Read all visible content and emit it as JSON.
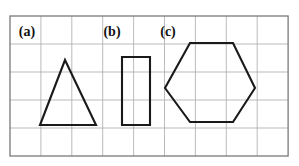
{
  "canvas": {
    "width": 299,
    "height": 166,
    "background": "#ffffff"
  },
  "grid": {
    "x0": 10,
    "y0": 16,
    "columns": 9,
    "rows": 5,
    "cell_width": 30.9,
    "cell_height": 28.0,
    "line_color": "#a9a9a9",
    "border_color": "#6e6e6e"
  },
  "style": {
    "shape_stroke": "#1a1a1a",
    "shape_stroke_width": 2.1,
    "label_color": "#111111"
  },
  "figures": [
    {
      "key": "triangle",
      "label": "(a)",
      "label_x": 27,
      "label_y": 33,
      "shape": "triangle",
      "points": "65,60 96,125 40,125"
    },
    {
      "key": "rectangle",
      "label": "(b)",
      "label_x": 112,
      "label_y": 33,
      "shape": "rectangle",
      "points": "122,57 150,57 150,125 122,125"
    },
    {
      "key": "hexagon",
      "label": "(c)",
      "label_x": 168,
      "label_y": 33,
      "shape": "hexagon",
      "points": "190,43 233,43 255,88 233,122 190,122 165,88"
    }
  ]
}
